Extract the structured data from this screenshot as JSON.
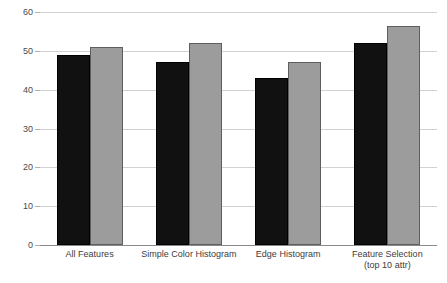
{
  "chart_data": {
    "type": "bar",
    "title": "",
    "subtitle": "",
    "xlabel": "",
    "ylabel": "",
    "ylim": [
      0,
      60
    ],
    "yticks": [
      0,
      10,
      20,
      30,
      40,
      50,
      60
    ],
    "ytick_labels": [
      "0",
      "10",
      "20",
      "30",
      "40",
      "50",
      "60"
    ],
    "grid": true,
    "legend": "none",
    "categories": [
      "All Features",
      "Simple Color Histogram",
      "Edge Histogram",
      "Feature Selection (top 10 attr)"
    ],
    "category_lines": [
      [
        "All Features"
      ],
      [
        "Simple Color Histogram"
      ],
      [
        "Edge Histogram"
      ],
      [
        "Feature Selection",
        "(top 10 attr)"
      ]
    ],
    "series": [
      {
        "name": "series-a",
        "color": "#111111",
        "edge_color": "#000000",
        "values": [
          49,
          47,
          43,
          52
        ]
      },
      {
        "name": "series-b",
        "color": "#9c9c9c",
        "edge_color": "#5e5e5e",
        "values": [
          51,
          52,
          47,
          56.5
        ]
      }
    ]
  },
  "colors": {
    "background": "#ffffff",
    "gridline": "#d2d2d2",
    "axis": "#8a8a8a",
    "tick_text": "#4a4a4a",
    "label_text": "#3c3c3c"
  }
}
